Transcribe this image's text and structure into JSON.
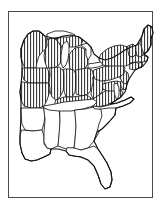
{
  "figure": {
    "kind": "choropleth-map",
    "region": "Eastern United States",
    "frame": {
      "border_color": "#4a4a4a",
      "background_color": "#ffffff",
      "x": 8,
      "y": 11,
      "width": 145,
      "height": 187
    }
  },
  "style": {
    "shaded_pattern": "vertical-hatch",
    "hatch_color": "#3c3c3c",
    "hatch_spacing_px": 3,
    "hatch_line_width_px": 1.1,
    "unshaded_fill": "#ffffff",
    "outline_color": "#1a1a1a",
    "coast_outline_color": "#111111"
  },
  "legend_implied": {
    "shaded_meaning": "included / highlighted states",
    "unshaded_meaning": "excluded states"
  },
  "map_data": {
    "shaded_states": [
      "Minnesota",
      "Wisconsin",
      "Michigan",
      "Iowa",
      "Illinois",
      "Indiana",
      "Ohio",
      "Missouri",
      "Kentucky",
      "West Virginia",
      "Virginia",
      "Maryland",
      "Delaware",
      "New Jersey",
      "Pennsylvania",
      "New York",
      "Connecticut",
      "Rhode Island",
      "Massachusetts",
      "Vermont",
      "New Hampshire",
      "Maine"
    ],
    "unshaded_states": [
      "Arkansas",
      "Louisiana",
      "Mississippi",
      "Alabama",
      "Tennessee",
      "Georgia",
      "Florida",
      "South Carolina",
      "North Carolina"
    ],
    "water_bodies": [
      "Lake Michigan",
      "Lake Superior",
      "Lake Huron",
      "Lake Erie",
      "Chesapeake Bay"
    ],
    "shaded_count": 22,
    "unshaded_count": 9
  }
}
